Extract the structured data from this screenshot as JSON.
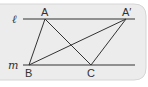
{
  "diagram": {
    "colors": {
      "panel_fill": "#ececec",
      "panel_border": "#d6d6d6",
      "stroke": "#333333",
      "text": "#333333"
    },
    "lines": [
      {
        "name": "l",
        "label": "ℓ"
      },
      {
        "name": "m",
        "label": "m"
      }
    ],
    "points": {
      "A": {
        "label": "A"
      },
      "A_prime": {
        "label": "A′"
      },
      "B": {
        "label": "B"
      },
      "C": {
        "label": "C"
      }
    },
    "segments": [
      "AB",
      "AC",
      "A'B",
      "A'C"
    ]
  }
}
